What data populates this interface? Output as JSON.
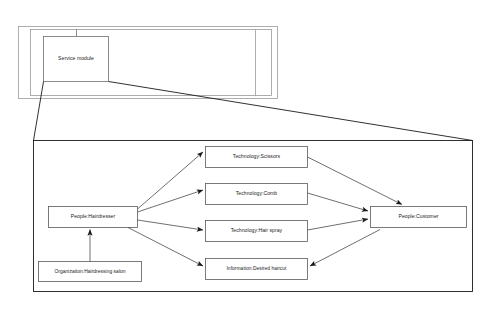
{
  "diagram": {
    "type": "uml-like zoom/detail diagram",
    "stroke_color": "#4d4d4d",
    "accent_stroke_color": "#1a1a1a",
    "background": "#ffffff",
    "overview_panel": {
      "name": "overview-panel",
      "outer_frame": {
        "x": 18,
        "y": 26,
        "width": 260,
        "height": 73
      },
      "inner_frame": {
        "x": 30,
        "y": 29,
        "width": 242,
        "height": 67
      },
      "node": {
        "name": "service-module",
        "label": "Service module",
        "x": 43,
        "y": 36,
        "width": 66,
        "height": 45
      },
      "connector_line": {
        "from": "top-frame-edge",
        "to": "service-module-top"
      }
    },
    "detail_panel": {
      "name": "detail-panel",
      "frame": {
        "x": 33,
        "y": 140,
        "width": 440,
        "height": 152
      },
      "zoom_links": [
        {
          "from": "service-module-bottom-left",
          "to": "detail-panel-top-left"
        },
        {
          "from": "service-module-bottom-right",
          "to": "detail-panel-top-right"
        }
      ],
      "nodes": [
        {
          "id": "hairdresser",
          "name": "node-people-hairdresser",
          "label": "People:Hairdresser",
          "x": 48,
          "y": 206,
          "width": 90,
          "height": 22
        },
        {
          "id": "salon",
          "name": "node-organization-hairdressing-salon",
          "label": "Organization:Hairdressing salon",
          "x": 38,
          "y": 261,
          "width": 104,
          "height": 21
        },
        {
          "id": "scissors",
          "name": "node-technology-scissors",
          "label": "Technology:Scissors",
          "x": 205,
          "y": 146,
          "width": 103,
          "height": 22
        },
        {
          "id": "comb",
          "name": "node-technology-comb",
          "label": "Technology:Comb",
          "x": 205,
          "y": 183,
          "width": 103,
          "height": 22
        },
        {
          "id": "hairspray",
          "name": "node-technology-hair-spray",
          "label": "Technology:Hair spray",
          "x": 205,
          "y": 220,
          "width": 103,
          "height": 22
        },
        {
          "id": "desired_haircut",
          "name": "node-information-desired-haircut",
          "label": "Information:Desired haircut",
          "x": 205,
          "y": 258,
          "width": 103,
          "height": 22
        },
        {
          "id": "customer",
          "name": "node-people-customer",
          "label": "People:Customer",
          "x": 370,
          "y": 206,
          "width": 97,
          "height": 22
        }
      ],
      "edges": [
        {
          "name": "edge-hairdresser-to-scissors",
          "from": "hairdresser",
          "to": "scissors",
          "arrow": "to"
        },
        {
          "name": "edge-hairdresser-to-comb",
          "from": "hairdresser",
          "to": "comb",
          "arrow": "to"
        },
        {
          "name": "edge-hairdresser-to-hairspray",
          "from": "hairdresser",
          "to": "hairspray",
          "arrow": "to"
        },
        {
          "name": "edge-hairdresser-to-haircut",
          "from": "hairdresser",
          "to": "desired_haircut",
          "arrow": "to"
        },
        {
          "name": "edge-salon-to-hairdresser",
          "from": "salon",
          "to": "hairdresser",
          "arrow": "to"
        },
        {
          "name": "edge-scissors-to-customer",
          "from": "scissors",
          "to": "customer",
          "arrow": "to"
        },
        {
          "name": "edge-comb-to-customer",
          "from": "comb",
          "to": "customer",
          "arrow": "to"
        },
        {
          "name": "edge-hairspray-to-customer",
          "from": "hairspray",
          "to": "customer",
          "arrow": "to"
        },
        {
          "name": "edge-customer-to-haircut",
          "from": "customer",
          "to": "desired_haircut",
          "arrow": "to"
        }
      ]
    }
  }
}
